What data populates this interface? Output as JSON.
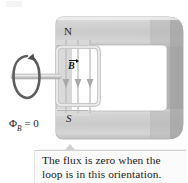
{
  "figure": {
    "name": "magnetic-flux-zero-orientation-diagram",
    "background": "#ffffff",
    "width": 188,
    "height": 183
  },
  "magnet": {
    "shape": "c-shaped-yoke",
    "fill_light": "#e2e2e2",
    "fill_mid": "#cdcdcd",
    "fill_dark": "#a9a9a9",
    "outline": "#9a9a9a",
    "pole_north_label": "N",
    "pole_south_label": "S"
  },
  "field": {
    "vector_label": "B",
    "direction": "downward",
    "line_count": 3,
    "line_color": "#b4b4b4",
    "arrow_color": "#9d9d9d"
  },
  "loop": {
    "name": "rotating-wire-loop",
    "orientation": "edge-on",
    "fill": "#ededed",
    "stroke": "#b9b9b9"
  },
  "axle": {
    "name": "rotation-axle",
    "color": "#c4c4c4",
    "rotation_arrow_color": "#5b5b5b"
  },
  "labels": {
    "flux_symbol": "Φ",
    "flux_subscript": "B",
    "flux_equation_tail": " = 0"
  },
  "caption": {
    "line_1": "The flux is zero when the",
    "line_2": "loop is in this orientation.",
    "background": "#fbfbfb",
    "border": "#d2d2d2"
  }
}
